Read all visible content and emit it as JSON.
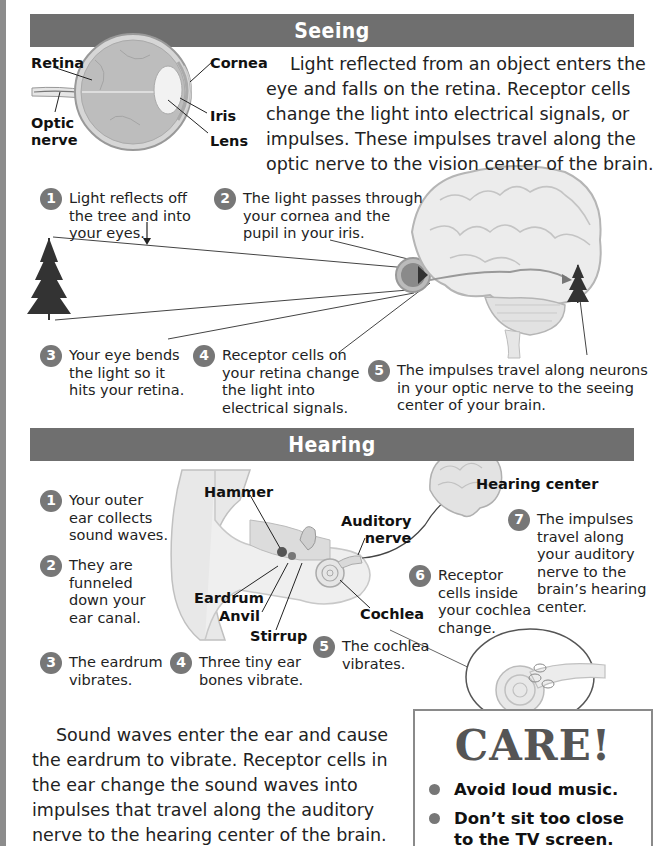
{
  "colors": {
    "section_bar": "#6f6f6f",
    "step_badge": "#777777",
    "edge_strip": "#8c8c8c",
    "care_border": "#8a8a8a",
    "care_title": "#555555"
  },
  "seeing": {
    "title": "Seeing",
    "eye_labels": {
      "retina": "Retina",
      "optic_nerve": "Optic\nnerve",
      "cornea": "Cornea",
      "iris": "Iris",
      "lens": "Lens"
    },
    "intro": "Light reflected from an object enters the eye and falls on the retina. Receptor cells change the light into electrical signals, or impulses. These impulses travel along the optic nerve to the vision center of the brain.",
    "steps": [
      {
        "num": "1",
        "text": "Light reflects off\nthe tree and into\nyour eyes."
      },
      {
        "num": "2",
        "text": "The light passes through\nyour cornea and the\npupil in your iris."
      },
      {
        "num": "3",
        "text": "Your eye bends\nthe light so it\nhits your retina."
      },
      {
        "num": "4",
        "text": "Receptor cells on\nyour retina change\nthe light into\nelectrical signals."
      },
      {
        "num": "5",
        "text": "The impulses travel along neurons\nin your optic nerve to the seeing\ncenter of your brain."
      }
    ]
  },
  "hearing": {
    "title": "Hearing",
    "ear_labels": {
      "hammer": "Hammer",
      "eardrum": "Eardrum",
      "anvil": "Anvil",
      "stirrup": "Stirrup",
      "auditory_nerve": "Auditory\nnerve",
      "cochlea": "Cochlea",
      "hearing_center": "Hearing center"
    },
    "steps": [
      {
        "num": "1",
        "text": "Your outer\near collects\nsound waves."
      },
      {
        "num": "2",
        "text": "They are\nfunneled\ndown your\near canal."
      },
      {
        "num": "3",
        "text": "The eardrum\nvibrates."
      },
      {
        "num": "4",
        "text": "Three tiny ear\nbones vibrate."
      },
      {
        "num": "5",
        "text": "The cochlea\nvibrates."
      },
      {
        "num": "6",
        "text": "Receptor\ncells inside\nyour cochlea\nchange."
      },
      {
        "num": "7",
        "text": "The impulses\ntravel along\nyour auditory\nnerve to the\nbrain’s hearing\ncenter."
      }
    ],
    "summary": "Sound waves enter the ear and cause the eardrum to vibrate. Receptor cells in the ear change the sound waves into impulses that travel along the auditory nerve to the hearing center of the brain."
  },
  "care": {
    "title": "CARE!",
    "items": [
      "Avoid loud music.",
      "Don’t sit too close to the TV screen."
    ]
  }
}
